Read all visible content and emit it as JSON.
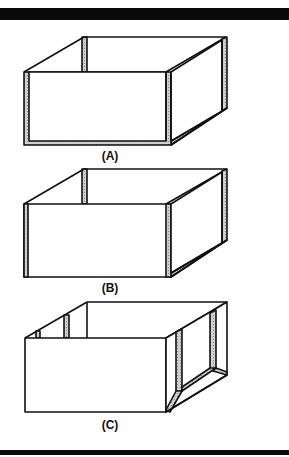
{
  "figure": {
    "panels": [
      {
        "id": "A",
        "label": "(A)",
        "description": "Open box with reinforced corner posts and bottom frame on front and right sides"
      },
      {
        "id": "B",
        "label": "(B)",
        "description": "Open box with reinforced vertical corner posts and right bottom edge"
      },
      {
        "id": "C",
        "label": "(C)",
        "description": "Open box with framed openings on back-left and right side panels"
      }
    ]
  },
  "colors": {
    "line": "#111111",
    "hatch": "#bdbdbd",
    "bar": "#0a0a0a"
  }
}
